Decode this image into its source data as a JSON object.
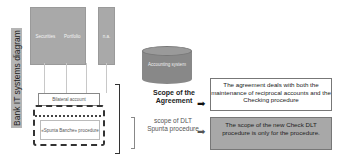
{
  "diagram": {
    "side_label": "Bank IT systems diagram",
    "systems": [
      {
        "label": "Securities"
      },
      {
        "label": "Portfolio"
      },
      {
        "label": "n.a."
      }
    ],
    "bilateral_account": "Bilateral account",
    "spunta_procedure": "«Spunta Banche» procedure",
    "accounting_system": "Accounting system",
    "scope_agreement": "Scope of the Agreement",
    "scope_dlt": "scope of DLT Spunta procedure",
    "description_agreement": "The agreement deals with both the maintenance of reciprocal accounts and the Checking procedure",
    "description_dlt": "The scope of the new Check DLT procedure is only for the procedure.",
    "colors": {
      "system_box": "#a9a9a9",
      "side_label_bg": "#b5b5b5",
      "cylinder": "#888888",
      "dlt_box": "#a8a8a8"
    }
  }
}
